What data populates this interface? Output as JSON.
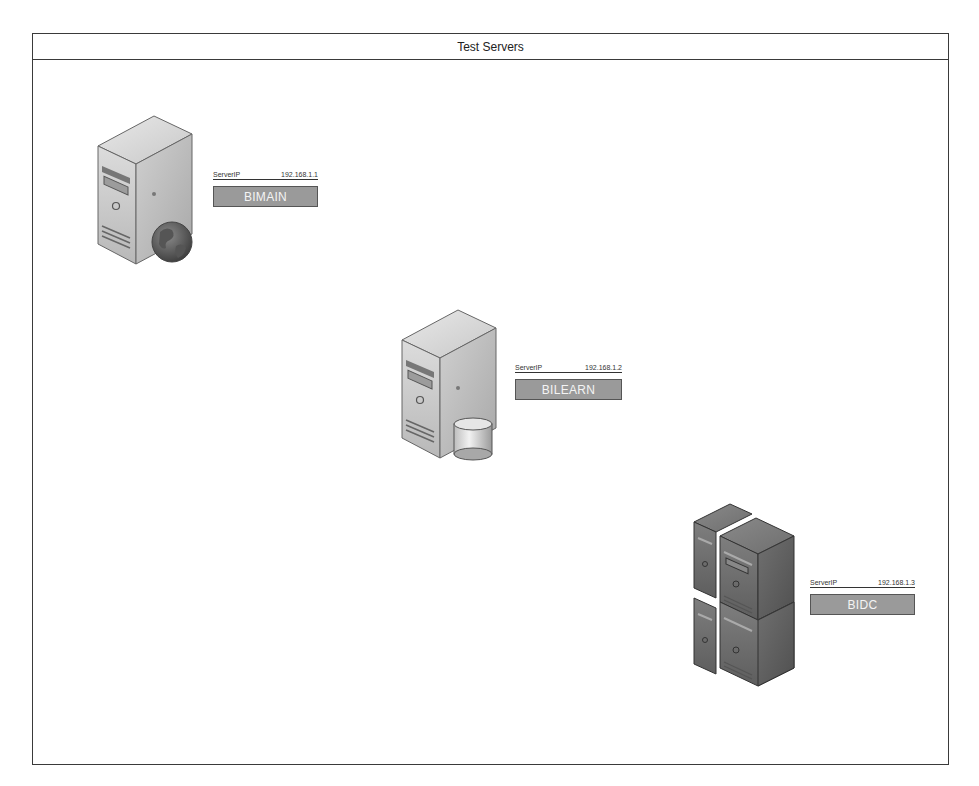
{
  "diagram": {
    "title": "Test Servers",
    "servers": [
      {
        "name": "BIMAIN",
        "ip_label": "ServerIP",
        "ip": "192.168.1.1",
        "type": "web-server",
        "badge_icon": "globe"
      },
      {
        "name": "BILEARN",
        "ip_label": "ServerIP",
        "ip": "192.168.1.2",
        "type": "database-server",
        "badge_icon": "database"
      },
      {
        "name": "BIDC",
        "ip_label": "ServerIP",
        "ip": "192.168.1.3",
        "type": "server-cluster",
        "badge_icon": "none"
      }
    ]
  },
  "colors": {
    "frame_border": "#3a3a3a",
    "name_box_fill": "#9a9a9a",
    "name_box_text": "#f4f4f4",
    "server_light": "#d4d4d4",
    "server_dark": "#7a7a7a"
  }
}
